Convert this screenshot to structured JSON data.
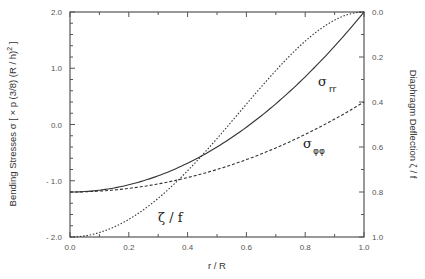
{
  "chart_data": {
    "type": "line",
    "title": "",
    "xlabel": "r / R",
    "ylabel_left": "Bending Stresses σ [ × p (3/8) (R / h)² ]",
    "ylabel_left_main": "Bending Stresses σ  [ × p (3/8) (R / h)",
    "ylabel_left_sup": "2",
    "ylabel_left_close": " ]",
    "ylabel_right": "Diaphragm Deflection ζ / f",
    "xlim": [
      0.0,
      1.0
    ],
    "ylim_left": [
      -2.0,
      2.0
    ],
    "ylim_right": [
      1.0,
      0.0
    ],
    "x_ticks": [
      "0.0",
      "0.2",
      "0.4",
      "0.6",
      "0.8",
      "1.0"
    ],
    "y_left_ticks": [
      "2.0",
      "1.0",
      "0.0",
      "- 1.0",
      "- 2.0"
    ],
    "y_right_ticks": [
      "0.0",
      "0.2",
      "0.4",
      "0.6",
      "0.8",
      "1.0"
    ],
    "grid": false,
    "x": [
      0.0,
      0.1,
      0.2,
      0.3,
      0.4,
      0.5,
      0.6,
      0.7,
      0.8,
      0.9,
      1.0
    ],
    "series": [
      {
        "name": "σ_rr",
        "label_main": "σ",
        "label_sub": "rr",
        "axis": "left",
        "style": "solid",
        "values": [
          -1.2,
          -1.168,
          -1.072,
          -0.912,
          -0.688,
          -0.4,
          -0.048,
          0.368,
          0.848,
          1.392,
          2.0
        ]
      },
      {
        "name": "σ_φφ",
        "label_main": "σ",
        "label_sub": "φφ",
        "axis": "left",
        "style": "dashed",
        "values": [
          -1.2,
          -1.184,
          -1.136,
          -1.056,
          -0.944,
          -0.8,
          -0.624,
          -0.416,
          -0.176,
          0.096,
          0.4
        ]
      },
      {
        "name": "ζ / f",
        "label_main": "ζ / f",
        "label_sub": "",
        "axis": "right",
        "style": "dotted",
        "values": [
          1.0,
          0.98,
          0.922,
          0.828,
          0.706,
          0.563,
          0.41,
          0.26,
          0.13,
          0.036,
          0.0
        ]
      }
    ],
    "annotations": [
      "σ rr",
      "σ φφ",
      "ζ / f"
    ]
  }
}
